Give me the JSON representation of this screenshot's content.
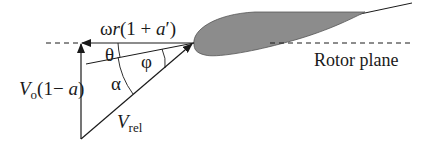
{
  "colors": {
    "line": "#1a1a1a",
    "airfoil_fill": "#8c8c8c",
    "airfoil_edge": "#555555",
    "background": "#ffffff"
  },
  "labels": {
    "tangential_omega": "ω",
    "tangential_r": "r",
    "tangential_rest_open": "(1 + ",
    "tangential_a": "a",
    "tangential_rest_close": "′)",
    "axial_V": "V",
    "axial_sub": "o",
    "axial_rest_open": "(1− ",
    "axial_a": "a",
    "axial_rest_close": ")",
    "relative_V": "V",
    "relative_sub": "rel",
    "theta": "θ",
    "phi": "φ",
    "alpha": "α",
    "rotor_plane": "Rotor plane"
  }
}
